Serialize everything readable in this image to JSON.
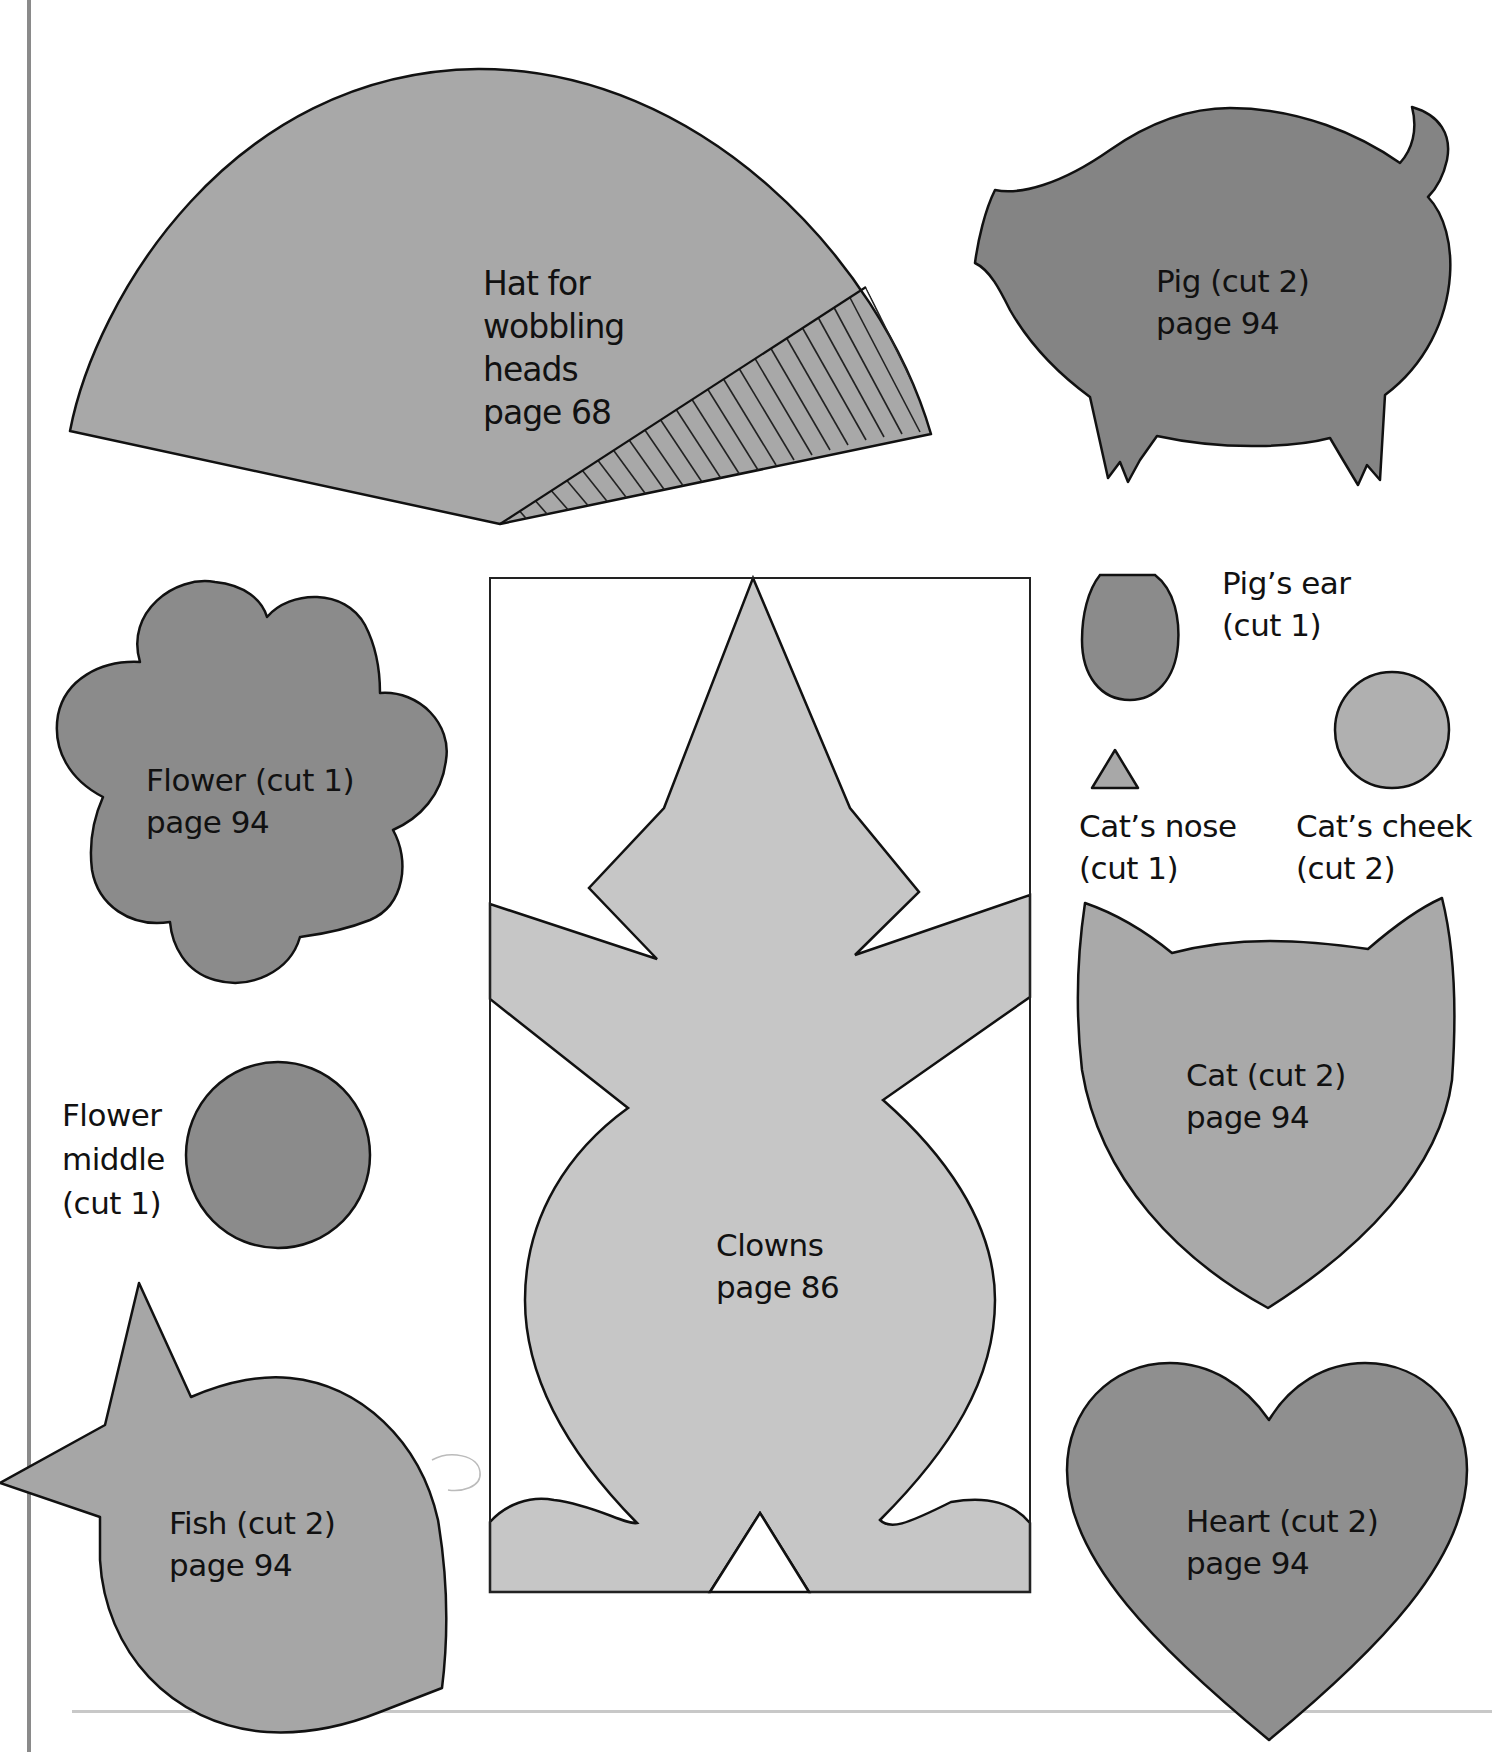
{
  "page": {
    "background": "#ffffff",
    "left_border_color": "#8a8a8a",
    "separator_color": "#c8c8c8"
  },
  "colors": {
    "hat": "#a8a8a8",
    "pig": "#848484",
    "flower": "#8b8b8b",
    "flower_middle": "#8b8b8b",
    "fish": "#a6a6a6",
    "clown": "#c6c6c6",
    "pig_ear": "#8b8b8b",
    "cat_nose": "#a8a8a8",
    "cat_cheek": "#b0b0b0",
    "cat": "#a9a9a9",
    "heart": "#8f8f8f",
    "outline": "#111111"
  },
  "templates": {
    "hat": {
      "lines": [
        "Hat for",
        "wobbling",
        "heads",
        "page 68"
      ]
    },
    "pig": {
      "lines": [
        "Pig (cut 2)",
        "page 94"
      ]
    },
    "flower": {
      "lines": [
        "Flower (cut 1)",
        "page 94"
      ]
    },
    "pig_ear": {
      "lines": [
        "Pig’s ear",
        "(cut 1)"
      ]
    },
    "cat_nose": {
      "lines": [
        "Cat’s nose",
        "(cut 1)"
      ]
    },
    "cat_cheek": {
      "lines": [
        "Cat’s cheek",
        "(cut 2)"
      ]
    },
    "cat": {
      "lines": [
        "Cat (cut 2)",
        "page 94"
      ]
    },
    "flower_middle": {
      "lines": [
        "Flower",
        "middle",
        "(cut 1)"
      ]
    },
    "clowns": {
      "lines": [
        "Clowns",
        "page 86"
      ]
    },
    "fish": {
      "lines": [
        "Fish (cut 2)",
        "page 94"
      ]
    },
    "heart": {
      "lines": [
        "Heart (cut 2)",
        "page 94"
      ]
    }
  }
}
